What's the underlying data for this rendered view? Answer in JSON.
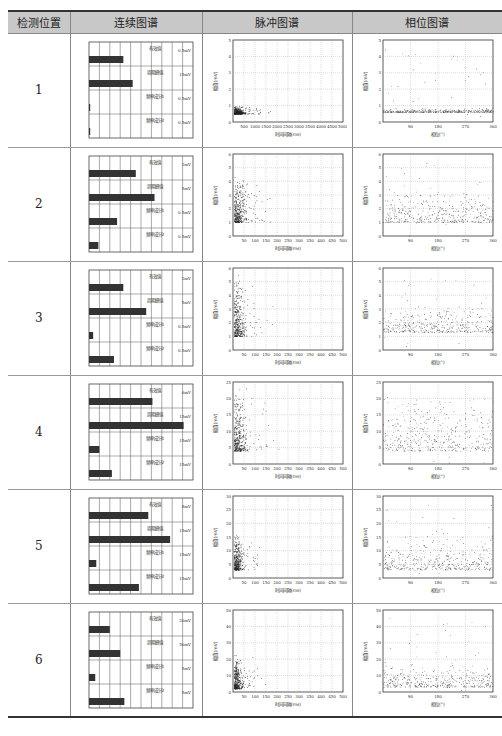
{
  "table": {
    "headers": [
      "检测位置",
      "连续图谱",
      "脉冲图谱",
      "相位图谱"
    ],
    "continuous_labels": [
      "有效值",
      "周期峰值",
      "频率成分1",
      "频率成分2"
    ],
    "pulse_xlabel": "时间间隔(ms)",
    "phase_xlabel": "相位(°)",
    "ylabel": "幅值(mV)",
    "rows": [
      {
        "position": "1",
        "continuous": {
          "bars": [
            0.33,
            0.42,
            0.01,
            0.01
          ],
          "units": [
            "0.5mV",
            "15mV",
            "0.5mV",
            "0.5mV"
          ]
        },
        "pulse": {
          "ymax": 5,
          "yticks": [
            "0",
            "1",
            "2",
            "3",
            "4",
            "5"
          ],
          "xticks": [
            "500",
            "1000",
            "1500",
            "2000",
            "2500",
            "3000",
            "3500",
            "4000",
            "4500",
            "5000"
          ],
          "cluster": {
            "x": [
              0,
              0.25
            ],
            "y": [
              0.5,
              0.9
            ]
          }
        },
        "phase": {
          "ymax": 5,
          "yticks": [
            "0",
            "1",
            "2",
            "3",
            "4",
            "5"
          ],
          "xticks": [
            "90",
            "180",
            "270",
            "360"
          ],
          "band": [
            0.6,
            0.8
          ]
        }
      },
      {
        "position": "2",
        "continuous": {
          "bars": [
            0.45,
            0.63,
            0.27,
            0.09
          ],
          "units": [
            "2mV",
            "5mV",
            "0.5mV",
            "0.5mV"
          ]
        },
        "pulse": {
          "ymax": 6,
          "yticks": [
            "0",
            "1",
            "2",
            "3",
            "4",
            "5",
            "6"
          ],
          "xticks": [
            "50",
            "100",
            "150",
            "200",
            "250",
            "300",
            "350",
            "400",
            "450",
            "500"
          ],
          "cluster": {
            "x": [
              0,
              0.3
            ],
            "y": [
              1,
              4
            ]
          }
        },
        "phase": {
          "ymax": 6,
          "yticks": [
            "0",
            "1",
            "2",
            "3",
            "4",
            "5",
            "6"
          ],
          "xticks": [
            "90",
            "180",
            "270",
            "360"
          ],
          "band": [
            1,
            3
          ]
        }
      },
      {
        "position": "3",
        "continuous": {
          "bars": [
            0.33,
            0.55,
            0.04,
            0.24
          ],
          "units": [
            "2mV",
            "5mV",
            "0.5mV",
            "0.5mV"
          ]
        },
        "pulse": {
          "ymax": 6,
          "yticks": [
            "0",
            "1",
            "2",
            "3",
            "4",
            "5",
            "6"
          ],
          "xticks": [
            "50",
            "100",
            "150",
            "200",
            "250",
            "300",
            "350",
            "400",
            "450",
            "500"
          ],
          "cluster": {
            "x": [
              0,
              0.25
            ],
            "y": [
              1,
              5
            ]
          }
        },
        "phase": {
          "ymax": 6,
          "yticks": [
            "0",
            "1",
            "2",
            "3",
            "4",
            "5",
            "6"
          ],
          "xticks": [
            "90",
            "180",
            "270",
            "360"
          ],
          "band": [
            1.3,
            3
          ]
        }
      },
      {
        "position": "4",
        "continuous": {
          "bars": [
            0.61,
            0.91,
            0.1,
            0.22
          ],
          "units": [
            "6mV",
            "15mV",
            "15mV",
            "15mV"
          ]
        },
        "pulse": {
          "ymax": 25,
          "yticks": [
            "0",
            "5",
            "10",
            "15",
            "20",
            "25"
          ],
          "xticks": [
            "50",
            "100",
            "150",
            "200",
            "250",
            "300",
            "350",
            "400",
            "450",
            "500"
          ],
          "cluster": {
            "x": [
              0,
              0.3
            ],
            "y": [
              4,
              20
            ]
          }
        },
        "phase": {
          "ymax": 25,
          "yticks": [
            "0",
            "5",
            "10",
            "15",
            "20",
            "25"
          ],
          "xticks": [
            "90",
            "180",
            "270",
            "360"
          ],
          "band": [
            4,
            18
          ]
        }
      },
      {
        "position": "5",
        "continuous": {
          "bars": [
            0.57,
            0.78,
            0.07,
            0.48
          ],
          "units": [
            "8mV",
            "15mV",
            "15mV",
            "15mV"
          ]
        },
        "pulse": {
          "ymax": 30,
          "yticks": [
            "0",
            "5",
            "10",
            "15",
            "20",
            "25",
            "30"
          ],
          "xticks": [
            "50",
            "100",
            "150",
            "200",
            "250",
            "300",
            "350",
            "400",
            "450",
            "500"
          ],
          "cluster": {
            "x": [
              0,
              0.2
            ],
            "y": [
              3,
              15
            ]
          }
        },
        "phase": {
          "ymax": 30,
          "yticks": [
            "0",
            "5",
            "10",
            "15",
            "20",
            "25",
            "30"
          ],
          "xticks": [
            "90",
            "180",
            "270",
            "360"
          ],
          "band": [
            3,
            14
          ]
        }
      },
      {
        "position": "6",
        "continuous": {
          "bars": [
            0.2,
            0.3,
            0.06,
            0.34
          ],
          "units": [
            "20mV",
            "50mV",
            "5mV",
            "5mV"
          ]
        },
        "pulse": {
          "ymax": 50,
          "yticks": [
            "0",
            "10",
            "20",
            "30",
            "40",
            "50"
          ],
          "xticks": [
            "50",
            "100",
            "150",
            "200",
            "250",
            "300",
            "350",
            "400",
            "450",
            "500"
          ],
          "cluster": {
            "x": [
              0,
              0.2
            ],
            "y": [
              2,
              20
            ]
          }
        },
        "phase": {
          "ymax": 50,
          "yticks": [
            "0",
            "10",
            "20",
            "30",
            "40",
            "50"
          ],
          "xticks": [
            "90",
            "180",
            "270",
            "360"
          ],
          "band": [
            3,
            15
          ]
        }
      }
    ]
  }
}
